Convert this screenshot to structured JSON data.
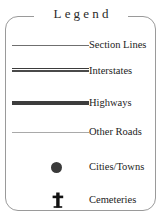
{
  "legend": {
    "title": "Legend",
    "rows": [
      {
        "symbol": "section-lines-symbol",
        "label": "Section Lines"
      },
      {
        "symbol": "interstates-symbol",
        "label": "Interstates"
      },
      {
        "symbol": "highways-symbol",
        "label": "Highways"
      },
      {
        "symbol": "other-roads-symbol",
        "label": "Other Roads"
      },
      {
        "symbol": "cities-towns-symbol",
        "label": "Cities/Towns"
      },
      {
        "symbol": "cemeteries-symbol",
        "label": "Cemeteries"
      }
    ],
    "colors": {
      "border": "#9a9a9a",
      "title_text": "#2a2a2a",
      "label_text": "#232323",
      "section_line": "#6f6f6f",
      "interstate_line": "#3b3b3b",
      "highway_line": "#3d3d3d",
      "other_road_line": "#a9a9a9",
      "city_dot": "#3a3a3a",
      "cemetery_cross": "#111111",
      "background": "#ffffff"
    }
  }
}
